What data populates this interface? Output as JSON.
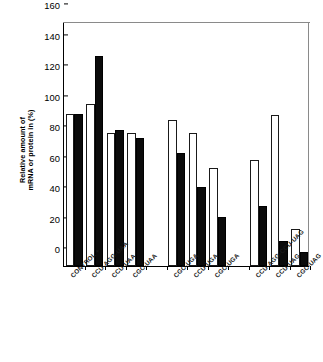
{
  "chart_data": {
    "type": "bar",
    "title": "",
    "subtitle": "",
    "xlabel": "",
    "ylabel": "Relative amount of mRNA or protein in (%)",
    "ylabel_line1": "Relative amount of",
    "ylabel_line2": "mRNA or protein in (%)",
    "ylim": [
      0,
      160
    ],
    "yticks": [
      0,
      20,
      40,
      60,
      80,
      100,
      120,
      140,
      160
    ],
    "ytick_labels": [
      "0",
      "20",
      "40",
      "60",
      "80",
      "100",
      "120",
      "140",
      "160"
    ],
    "grid": false,
    "legend": "none",
    "legend_entries": [
      {
        "name": "mRNA",
        "style": "open-white-bar"
      },
      {
        "name": "protein",
        "style": "filled-black-bar"
      }
    ],
    "categories": [
      "CONTROL +",
      "CCU-AGG-UAA",
      "CCU-UAA",
      "CGC-UAA",
      "",
      "CGC-UGA",
      "CCU-UGA",
      "CGC-UGA",
      "",
      "CCU-AGG-CCU-UAG",
      "CCU-UAG",
      "CGC-UAG"
    ],
    "series": [
      {
        "name": "open",
        "fill": "#ffffff",
        "values": [
          100,
          106,
          87.5,
          87.5,
          null,
          95.5,
          87.5,
          64,
          null,
          69.5,
          99,
          24.5
        ]
      },
      {
        "name": "filled",
        "fill": "#000000",
        "values": [
          100,
          137.5,
          89.5,
          84,
          null,
          74,
          51.5,
          32,
          null,
          39.5,
          16.5,
          9
        ]
      }
    ]
  }
}
